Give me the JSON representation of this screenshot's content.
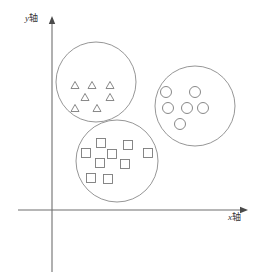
{
  "figure": {
    "title": "",
    "width": 263,
    "height": 280,
    "background": "#ffffff"
  },
  "axes": {
    "x_label_var": "x",
    "x_label_text": "轴",
    "y_label_var": "y",
    "y_label_text": "轴",
    "x_label_full": "x轴",
    "y_label_full": "y轴",
    "origin": {
      "x": 52,
      "y": 210
    },
    "x_axis": {
      "x1": 18,
      "y1": 210,
      "x2": 248,
      "y2": 210,
      "arrow": "right"
    },
    "y_axis": {
      "x1": 52,
      "y1": 272,
      "x2": 52,
      "y2": 16,
      "arrow": "up"
    },
    "color": "#6f6f6f",
    "arrow_color": "#4a4a4a",
    "ticks": [],
    "grid": false
  },
  "chart_data": {
    "type": "scatter",
    "title": "",
    "xlabel": "x轴",
    "ylabel": "y轴",
    "grid": false,
    "legend_position": "none",
    "xlim": [
      18,
      248
    ],
    "ylim": [
      272,
      16
    ],
    "annotation": "Three circled clusters of point markers on an x-y coordinate system",
    "clusters": [
      {
        "name": "triangle-cluster",
        "marker": "triangle",
        "count": 7,
        "ring": {
          "cx": 96,
          "cy": 82,
          "r": 40
        },
        "marker_size": 8,
        "color": "#7a7a7a",
        "points": [
          {
            "x": 75,
            "y": 85
          },
          {
            "x": 92,
            "y": 85
          },
          {
            "x": 110,
            "y": 85
          },
          {
            "x": 85,
            "y": 97
          },
          {
            "x": 110,
            "y": 97
          },
          {
            "x": 75,
            "y": 108
          },
          {
            "x": 97,
            "y": 108
          }
        ]
      },
      {
        "name": "circle-cluster",
        "marker": "circle",
        "count": 6,
        "ring": {
          "cx": 195,
          "cy": 106,
          "r": 40
        },
        "marker_size": 11,
        "color": "#7a7a7a",
        "points": [
          {
            "x": 166,
            "y": 92
          },
          {
            "x": 195,
            "y": 92
          },
          {
            "x": 168,
            "y": 108
          },
          {
            "x": 187,
            "y": 108
          },
          {
            "x": 203,
            "y": 108
          },
          {
            "x": 180,
            "y": 124
          }
        ]
      },
      {
        "name": "square-cluster",
        "marker": "square",
        "count": 9,
        "ring": {
          "cx": 117,
          "cy": 161,
          "r": 41
        },
        "marker_size": 9,
        "color": "#7a7a7a",
        "points": [
          {
            "x": 101,
            "y": 143
          },
          {
            "x": 128,
            "y": 145
          },
          {
            "x": 86,
            "y": 153
          },
          {
            "x": 112,
            "y": 154
          },
          {
            "x": 148,
            "y": 153
          },
          {
            "x": 100,
            "y": 163
          },
          {
            "x": 125,
            "y": 164
          },
          {
            "x": 91,
            "y": 178
          },
          {
            "x": 108,
            "y": 179
          }
        ]
      }
    ]
  }
}
